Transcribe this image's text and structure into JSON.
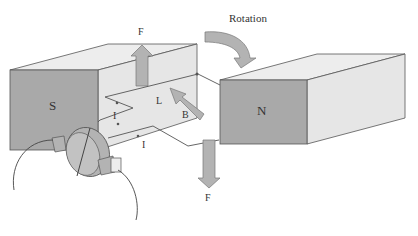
{
  "diagram": {
    "labels": {
      "rotation": "Rotation",
      "south_pole": "S",
      "north_pole": "N",
      "force_top": "F",
      "force_bottom": "F",
      "length": "L",
      "field": "B",
      "current_top": "I",
      "current_bottom": "I"
    },
    "colors": {
      "magnet_face": "#a9a9a9",
      "magnet_side": "#e6e6e6",
      "magnet_top": "#ededed",
      "arrow_fill": "#b3b3b3",
      "outline": "#555555"
    }
  }
}
